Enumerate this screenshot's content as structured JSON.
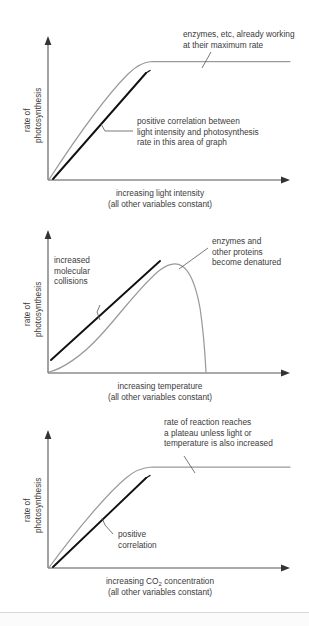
{
  "page": {
    "background_color": "#ffffff",
    "text_color": "#3b3b3b",
    "curve_color": "#9a9a9a",
    "highlight_color": "#111111",
    "axis_color": "#555555"
  },
  "charts": [
    {
      "id": "light-intensity",
      "type": "line",
      "title": "",
      "xlabel": "increasing light intensity",
      "xlabel_sub": "(all other variables constant)",
      "ylabel_line1": "rate of",
      "ylabel_line2": "photosynthesis",
      "xlim": [
        0,
        100
      ],
      "ylim": [
        0,
        100
      ],
      "grid": false,
      "legend": "none",
      "series": [
        {
          "name": "rate of photosynthesis vs light intensity",
          "color": "#9a9a9a",
          "x": [
            0,
            5,
            10,
            15,
            20,
            25,
            30,
            35,
            40,
            42,
            45,
            48,
            52,
            60,
            70,
            80,
            90,
            100
          ],
          "y": [
            0,
            8,
            17,
            25,
            34,
            42,
            51,
            59,
            68,
            71,
            76,
            79,
            80.5,
            81,
            81,
            81,
            81,
            81
          ]
        },
        {
          "name": "linear region highlight",
          "color": "#111111",
          "x": [
            2,
            42
          ],
          "y": [
            0,
            74
          ]
        }
      ],
      "annotations": [
        {
          "name": "plateau-note",
          "lines": [
            "enzymes, etc, already working",
            "at their maximum rate"
          ],
          "points_to": "plateau of curve"
        },
        {
          "name": "linear-region-note",
          "lines": [
            "positive correlation between",
            "light intensity and photosynthesis",
            "rate in this area of graph"
          ],
          "points_to": "straight portion of curve"
        }
      ]
    },
    {
      "id": "temperature",
      "type": "line",
      "title": "",
      "xlabel": "increasing temperature",
      "xlabel_sub": "(all other variables constant)",
      "ylabel_line1": "rate of",
      "ylabel_line2": "photosynthesis",
      "xlim": [
        0,
        100
      ],
      "ylim": [
        0,
        100
      ],
      "grid": false,
      "legend": "none",
      "series": [
        {
          "name": "rate of photosynthesis vs temperature",
          "color": "#9a9a9a",
          "x": [
            0,
            5,
            10,
            15,
            20,
            25,
            30,
            35,
            40,
            45,
            50,
            52,
            55,
            58,
            60,
            62,
            64,
            66,
            68
          ],
          "y": [
            0,
            3,
            7,
            13,
            21,
            31,
            44,
            58,
            72,
            83,
            88,
            88,
            86,
            80,
            70,
            55,
            36,
            15,
            0
          ]
        },
        {
          "name": "increased collisions highlight",
          "color": "#111111",
          "x": [
            2,
            48
          ],
          "y": [
            4,
            89
          ]
        }
      ],
      "annotations": [
        {
          "name": "collisions-note",
          "lines": [
            "increased",
            "molecular",
            "collisions"
          ],
          "points_to": "rising straight portion"
        },
        {
          "name": "denatured-note",
          "lines": [
            "enzymes and",
            "other proteins",
            "become denatured"
          ],
          "points_to": "peak and falling portion"
        }
      ]
    },
    {
      "id": "co2-concentration",
      "type": "line",
      "title": "",
      "xlabel_pre": "increasing CO",
      "xlabel_subscript": "2",
      "xlabel_post": " concentration",
      "xlabel_sub": "(all other variables constant)",
      "ylabel_line1": "rate of",
      "ylabel_line2": "photosynthesis",
      "xlim": [
        0,
        100
      ],
      "ylim": [
        0,
        100
      ],
      "grid": false,
      "legend": "none",
      "series": [
        {
          "name": "rate of photosynthesis vs CO2 concentration",
          "color": "#9a9a9a",
          "x": [
            0,
            5,
            10,
            15,
            20,
            25,
            30,
            35,
            38,
            42,
            46,
            50,
            60,
            70,
            80,
            90,
            100
          ],
          "y": [
            0,
            9,
            18,
            27,
            36,
            45,
            54,
            63,
            68,
            73,
            77,
            78,
            78.5,
            78.5,
            78.5,
            78.5,
            78.5
          ]
        },
        {
          "name": "linear region highlight",
          "color": "#111111",
          "x": [
            2,
            42
          ],
          "y": [
            0,
            72
          ]
        }
      ],
      "annotations": [
        {
          "name": "plateau-note",
          "lines": [
            "rate of reaction reaches",
            "a plateau unless light or",
            "temperature is also increased"
          ],
          "points_to": "plateau of curve"
        },
        {
          "name": "positive-correlation-note",
          "lines": [
            "positive",
            "correlation"
          ],
          "points_to": "straight portion of curve"
        }
      ]
    }
  ]
}
